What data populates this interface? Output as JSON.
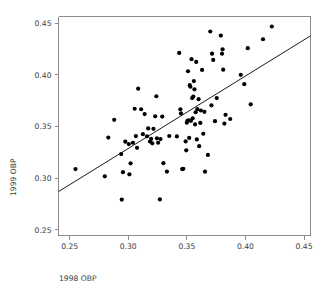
{
  "chart_data": {
    "type": "scatter",
    "title": "",
    "subtitle": "",
    "xlabel": "1998 OBP",
    "ylabel": "1999 OBP",
    "xlim": [
      0.2405,
      0.4555
    ],
    "ylim": [
      0.2445,
      0.4565
    ],
    "xticks": [
      0.25,
      0.3,
      0.35,
      0.4,
      0.45
    ],
    "yticks": [
      0.25,
      0.3,
      0.35,
      0.4,
      0.45
    ],
    "xtick_labels": [
      "0.25",
      "0.30",
      "0.35",
      "0.40",
      "0.45"
    ],
    "ytick_labels": [
      "0.25",
      "0.30",
      "0.35",
      "0.40",
      "0.45"
    ],
    "grid": false,
    "legend": null,
    "marker": "filled-circle",
    "marker_color": "#000000",
    "marker_size": 3.1,
    "n_points": 92,
    "points": [
      [
        0.255,
        0.3088
      ],
      [
        0.28,
        0.3018
      ],
      [
        0.283,
        0.3393
      ],
      [
        0.288,
        0.3565
      ],
      [
        0.294,
        0.3233
      ],
      [
        0.2945,
        0.2793
      ],
      [
        0.2955,
        0.3058
      ],
      [
        0.2975,
        0.3353
      ],
      [
        0.3005,
        0.333
      ],
      [
        0.301,
        0.3037
      ],
      [
        0.302,
        0.3144
      ],
      [
        0.304,
        0.3343
      ],
      [
        0.3055,
        0.3672
      ],
      [
        0.3065,
        0.3407
      ],
      [
        0.3075,
        0.3294
      ],
      [
        0.3085,
        0.3866
      ],
      [
        0.311,
        0.3667
      ],
      [
        0.3125,
        0.3426
      ],
      [
        0.314,
        0.362
      ],
      [
        0.316,
        0.3405
      ],
      [
        0.317,
        0.3482
      ],
      [
        0.3185,
        0.3355
      ],
      [
        0.3195,
        0.338
      ],
      [
        0.3205,
        0.3337
      ],
      [
        0.3215,
        0.3478
      ],
      [
        0.323,
        0.3599
      ],
      [
        0.324,
        0.3793
      ],
      [
        0.3245,
        0.3386
      ],
      [
        0.3255,
        0.3343
      ],
      [
        0.327,
        0.2794
      ],
      [
        0.3275,
        0.3378
      ],
      [
        0.329,
        0.3596
      ],
      [
        0.33,
        0.3145
      ],
      [
        0.333,
        0.3064
      ],
      [
        0.335,
        0.3408
      ],
      [
        0.3415,
        0.3404
      ],
      [
        0.3435,
        0.4212
      ],
      [
        0.3445,
        0.3667
      ],
      [
        0.345,
        0.3627
      ],
      [
        0.346,
        0.3088
      ],
      [
        0.347,
        0.309
      ],
      [
        0.349,
        0.3356
      ],
      [
        0.3495,
        0.327
      ],
      [
        0.35,
        0.3537
      ],
      [
        0.3505,
        0.3555
      ],
      [
        0.351,
        0.4035
      ],
      [
        0.3515,
        0.356
      ],
      [
        0.352,
        0.339
      ],
      [
        0.3525,
        0.39
      ],
      [
        0.353,
        0.3885
      ],
      [
        0.3535,
        0.3555
      ],
      [
        0.354,
        0.4152
      ],
      [
        0.3545,
        0.3775
      ],
      [
        0.355,
        0.358
      ],
      [
        0.3555,
        0.379
      ],
      [
        0.356,
        0.394
      ],
      [
        0.3565,
        0.386
      ],
      [
        0.357,
        0.352
      ],
      [
        0.3575,
        0.3638
      ],
      [
        0.358,
        0.4125
      ],
      [
        0.3585,
        0.3375
      ],
      [
        0.359,
        0.3668
      ],
      [
        0.36,
        0.3765
      ],
      [
        0.3605,
        0.331
      ],
      [
        0.3615,
        0.3535
      ],
      [
        0.362,
        0.3655
      ],
      [
        0.363,
        0.4048
      ],
      [
        0.364,
        0.343
      ],
      [
        0.365,
        0.3642
      ],
      [
        0.3655,
        0.3063
      ],
      [
        0.368,
        0.3225
      ],
      [
        0.37,
        0.442
      ],
      [
        0.371,
        0.3705
      ],
      [
        0.3715,
        0.4205
      ],
      [
        0.3725,
        0.4145
      ],
      [
        0.374,
        0.3552
      ],
      [
        0.3755,
        0.3775
      ],
      [
        0.379,
        0.438
      ],
      [
        0.38,
        0.4205
      ],
      [
        0.3805,
        0.4248
      ],
      [
        0.381,
        0.405
      ],
      [
        0.382,
        0.3528
      ],
      [
        0.383,
        0.3613
      ],
      [
        0.387,
        0.3573
      ],
      [
        0.396,
        0.4
      ],
      [
        0.399,
        0.391
      ],
      [
        0.402,
        0.4258
      ],
      [
        0.4045,
        0.3715
      ],
      [
        0.415,
        0.4345
      ],
      [
        0.4225,
        0.4468
      ]
    ],
    "fit_line": {
      "type": "linear-regression",
      "visible": true,
      "x_start": 0.2405,
      "y_start": 0.287,
      "x_end": 0.4555,
      "y_end": 0.4378,
      "color": "#000000"
    }
  },
  "axes": {
    "x_title": "1998 OBP",
    "y_title": "1999 OBP"
  }
}
